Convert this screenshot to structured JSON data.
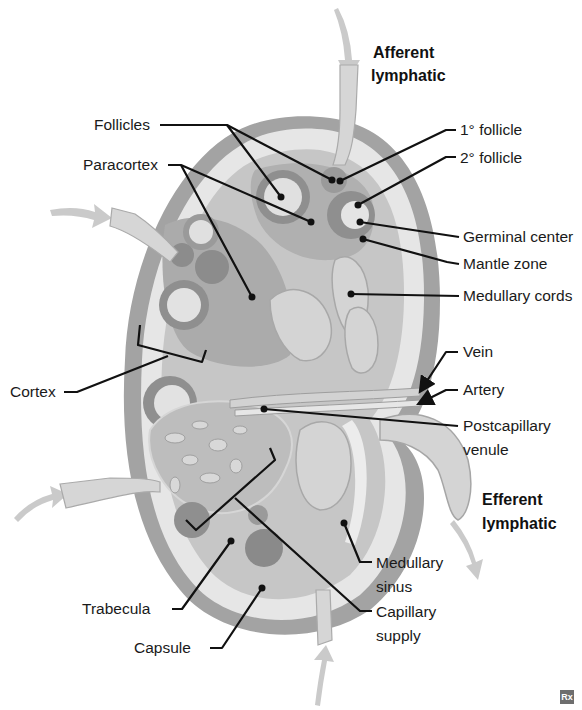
{
  "diagram": {
    "colors": {
      "capsule": "#9a9a9a",
      "subcapsular_sinus": "#e4e4e4",
      "cortex": "#c4c4c4",
      "paracortex": "#a9a9a9",
      "follicle_mantle": "#8e8e8e",
      "germinal_center": "#e2e2e2",
      "medulla": "#cfcfcf",
      "vessel": "#d9d9d9",
      "arrow": "#c8c8c8",
      "leader_line": "#111111"
    },
    "labels": {
      "afferent_lymphatic_top_1": "Afferent",
      "afferent_lymphatic_top_2": "lymphatic",
      "follicles": "Follicles",
      "paracortex": "Paracortex",
      "primary_follicle": "1° follicle",
      "secondary_follicle": "2° follicle",
      "germinal_center": "Germinal center",
      "mantle_zone": "Mantle zone",
      "medullary_cords": "Medullary cords",
      "vein": "Vein",
      "artery": "Artery",
      "postcapillary_venule_1": "Postcapillary",
      "postcapillary_venule_2": "venule",
      "cortex": "Cortex",
      "efferent_lymphatic_1": "Efferent",
      "efferent_lymphatic_2": "lymphatic",
      "medullary_sinus_1": "Medullary",
      "medullary_sinus_2": "sinus",
      "trabecula": "Trabecula",
      "capillary_supply_1": "Capillary",
      "capillary_supply_2": "supply",
      "capsule": "Capsule"
    },
    "badge": "Rx"
  }
}
